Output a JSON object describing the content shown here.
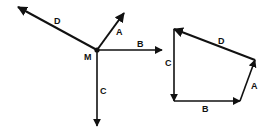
{
  "figure": {
    "left": {
      "point_label": "M",
      "vectors": [
        {
          "label": "A"
        },
        {
          "label": "B"
        },
        {
          "label": "C"
        },
        {
          "label": "D"
        }
      ]
    },
    "right": {
      "vectors": [
        {
          "label": "A"
        },
        {
          "label": "B"
        },
        {
          "label": "C"
        },
        {
          "label": "D"
        }
      ]
    },
    "colors": {
      "ink": "#111111",
      "background": "#ffffff"
    }
  }
}
